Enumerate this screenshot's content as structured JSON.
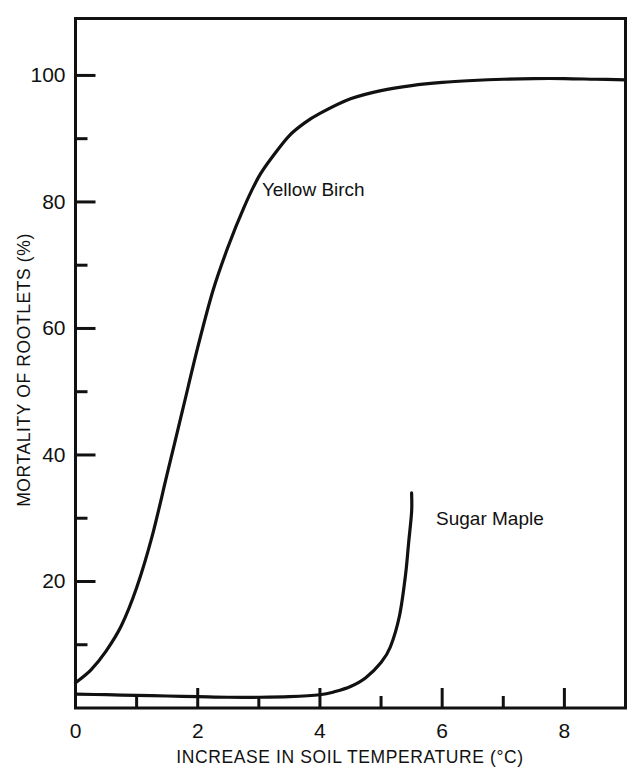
{
  "chart_data": {
    "type": "line",
    "title": "",
    "xlabel": "INCREASE IN SOIL TEMPERATURE (°C)",
    "ylabel": "MORTALITY OF ROOTLETS (%)",
    "xlim": [
      0,
      9.0
    ],
    "ylim": [
      0,
      109
    ],
    "grid": false,
    "legend_position": "inline-annotation",
    "x_major_ticks": [
      0,
      2,
      4,
      6,
      8
    ],
    "x_minor_ticks": [
      1,
      3,
      5,
      7
    ],
    "x_tick_labels": [
      "0",
      "2",
      "4",
      "6",
      "8"
    ],
    "y_major_ticks": [
      20,
      40,
      60,
      80,
      100
    ],
    "y_minor_ticks": [
      10,
      30,
      50,
      70,
      90
    ],
    "y_tick_labels": [
      "20",
      "40",
      "60",
      "80",
      "100"
    ],
    "series": [
      {
        "name": "Yellow Birch",
        "label_x": 3.05,
        "label_y": 81,
        "x": [
          0.0,
          0.25,
          0.5,
          0.75,
          1.0,
          1.25,
          1.5,
          1.75,
          2.0,
          2.25,
          2.5,
          2.75,
          3.0,
          3.25,
          3.5,
          3.75,
          4.0,
          4.5,
          5.0,
          5.5,
          6.0,
          6.5,
          7.0,
          7.5,
          8.0,
          8.5,
          9.0
        ],
        "y": [
          4,
          6,
          9,
          13,
          19,
          27,
          37,
          47,
          57,
          66,
          73,
          79,
          84,
          87.5,
          90.5,
          92.5,
          94,
          96.3,
          97.6,
          98.4,
          98.9,
          99.2,
          99.4,
          99.5,
          99.5,
          99.4,
          99.3
        ]
      },
      {
        "name": "Sugar Maple",
        "label_x": 5.9,
        "label_y": 29,
        "x": [
          0.0,
          0.5,
          1.0,
          1.5,
          2.0,
          2.5,
          3.0,
          3.5,
          4.0,
          4.25,
          4.5,
          4.75,
          5.0,
          5.15,
          5.3,
          5.4,
          5.45,
          5.5,
          5.5
        ],
        "y": [
          2.2,
          2.1,
          2.0,
          1.9,
          1.8,
          1.7,
          1.7,
          1.8,
          2.1,
          2.6,
          3.4,
          4.8,
          7.2,
          9.6,
          14.5,
          21.0,
          26.0,
          31.0,
          34.0
        ]
      }
    ]
  },
  "figure": {
    "frame_color": "#111111",
    "curve_color": "#111111",
    "background": "#ffffff"
  }
}
